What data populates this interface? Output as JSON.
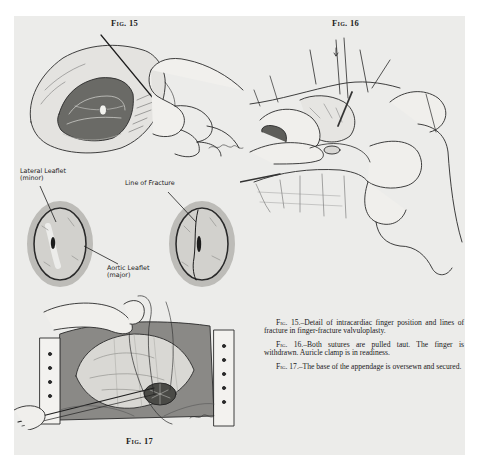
{
  "page": {
    "background": "#ececea",
    "margin_color": "#ffffff"
  },
  "figures": [
    {
      "id": "fig15",
      "heading": "Fig. 15",
      "heading_prefix": "Fig.",
      "heading_number": "15",
      "subject": "opened heart with finger inserted through auricle",
      "signature": "McCabe"
    },
    {
      "id": "fig16",
      "heading": "Fig. 16",
      "heading_prefix": "Fig.",
      "heading_number": "16",
      "subject": "hands pulling sutures taut at auricle"
    },
    {
      "id": "fig17",
      "heading": "Fig. 17",
      "heading_prefix": "Fig.",
      "heading_number": "17",
      "subject": "retracted chest wound with appendage oversewn",
      "signature": "McCabe"
    }
  ],
  "valve_labels": {
    "lateral_leaflet_line1": "Lateral Leaflet",
    "lateral_leaflet_line2": "(minor)",
    "line_of_fracture": "Line of Fracture",
    "aortic_leaflet_line1": "Aortic Leaflet",
    "aortic_leaflet_line2": "(major)"
  },
  "captions": [
    {
      "fig_ref": "Fig. 15.",
      "text": "–Detail of intracardiac finger position and lines of fracture in finger-fracture valvuloplasty."
    },
    {
      "fig_ref": "Fig. 16.",
      "text": "–Both sutures are pulled taut. The finger is withdrawn. Auricle clamp is in readiness."
    },
    {
      "fig_ref": "Fig. 17.",
      "text": "–The base of the appendage is oversewn and secured."
    }
  ]
}
